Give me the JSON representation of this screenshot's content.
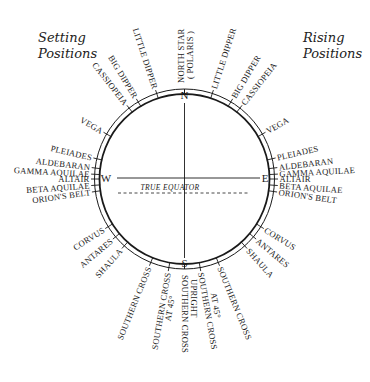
{
  "titles": {
    "setting_line1": "Setting",
    "setting_line2": "Positions",
    "rising_line1": "Rising",
    "rising_line2": "Positions"
  },
  "compass": {
    "north": "N",
    "south": "S",
    "east": "E",
    "west": "W"
  },
  "equator_label": "TRUE EQUATOR",
  "colors": {
    "ink": "#1a1a1a",
    "background": "#ffffff"
  },
  "stars": {
    "north_star": "NORTH STAR",
    "polaris": "( POLARIS )",
    "setting": [
      {
        "label": "LITTLE DIPPER",
        "angle": -18
      },
      {
        "label": "BIG DIPPER",
        "angle": -31
      },
      {
        "label": "CASSIOPEIA",
        "angle": -38
      },
      {
        "label": "VEGA",
        "angle": -60
      },
      {
        "label": "PLEIADES",
        "angle": -77
      },
      {
        "label": "ALDEBARAN",
        "angle": -83
      },
      {
        "label": "GAMMA AQUILAE",
        "angle": -87
      },
      {
        "label": "ALTAIR",
        "angle": -90
      },
      {
        "label": "BETA AQUILAE",
        "angle": -94
      },
      {
        "label": "ORION'S BELT",
        "angle": -98
      },
      {
        "label": "CORVUS",
        "angle": -122
      },
      {
        "label": "ANTARES",
        "angle": -130
      },
      {
        "label": "SHAULA",
        "angle": -138
      },
      {
        "label": "SOUTHERN CROSS",
        "angle": -158
      },
      {
        "label": "SOUTHERN CROSS",
        "sub": "AT 45°",
        "angle": -170
      }
    ],
    "rising": [
      {
        "label": "LITTLE DIPPER",
        "angle": 18
      },
      {
        "label": "BIG DIPPER",
        "angle": 31
      },
      {
        "label": "CASSIOPEIA",
        "angle": 38
      },
      {
        "label": "VEGA",
        "angle": 60
      },
      {
        "label": "PLEIADES",
        "angle": 77
      },
      {
        "label": "ALDEBARAN",
        "angle": 83
      },
      {
        "label": "GAMMA AQUILAE",
        "angle": 87
      },
      {
        "label": "ALTAIR",
        "angle": 90
      },
      {
        "label": "BETA AQUILAE",
        "angle": 94
      },
      {
        "label": "ORION'S BELT",
        "angle": 98
      },
      {
        "label": "CORVUS",
        "angle": 122
      },
      {
        "label": "ANTARES",
        "angle": 130
      },
      {
        "label": "SHAULA",
        "angle": 138
      },
      {
        "label": "SOUTHERN CROSS",
        "angle": 158
      },
      {
        "label": "SOUTHERN CROSS",
        "sub": "AT 45°",
        "angle": 170
      }
    ],
    "south_upright": "SOUTHERN CROSS",
    "south_upright_sub": "UPRIGHT"
  }
}
